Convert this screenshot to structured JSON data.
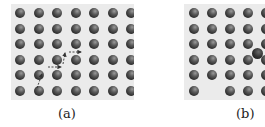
{
  "figure": {
    "panels": [
      {
        "id": "a",
        "label": "(a)",
        "description": "Perfect square lattice with dashed arrow path showing atom diffusion",
        "rows": 6,
        "cols": 7,
        "vacancies": [],
        "interstitials": []
      },
      {
        "id": "b",
        "label": "(b)",
        "description": "Square lattice with a vacancy in bottom row and an interstitial atom",
        "rows": 6,
        "cols": 5,
        "vacancies": [
          [
            5,
            1
          ]
        ],
        "interstitials": [
          [
            2.6,
            3.5
          ]
        ]
      }
    ]
  }
}
